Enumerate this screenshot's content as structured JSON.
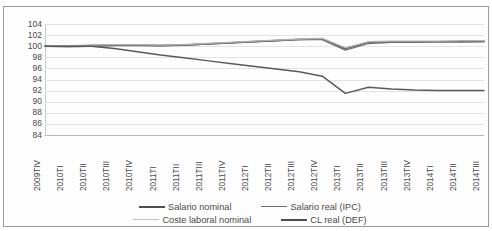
{
  "chart_data": {
    "type": "line",
    "title": "",
    "xlabel": "",
    "ylabel": "",
    "ylim": [
      84,
      104
    ],
    "ytick_step": 2,
    "yticks": [
      104,
      102,
      100,
      98,
      96,
      94,
      92,
      90,
      88,
      86,
      84
    ],
    "grid": true,
    "legend_position": "bottom",
    "categories": [
      "2009TIV",
      "2010TI",
      "2010TII",
      "2010TIII",
      "2010TIV",
      "2011TI",
      "2011TII",
      "2011TIII",
      "2011TIV",
      "2012TI",
      "2012TII",
      "2012TIII",
      "2012TIV",
      "2013TI",
      "2013TII",
      "2013TIII",
      "2013TIV",
      "2014TI",
      "2014TII",
      "2014TIII"
    ],
    "series": [
      {
        "name": "Salario nominal",
        "color": "#4d4d4d",
        "width": 1.6,
        "values": [
          100.0,
          100.0,
          100.1,
          100.2,
          100.2,
          100.1,
          100.2,
          100.4,
          100.6,
          100.8,
          101.0,
          101.2,
          101.3,
          99.6,
          100.7,
          100.8,
          100.8,
          100.8,
          100.8,
          100.9
        ]
      },
      {
        "name": "Salario real (IPC)",
        "color": "#6e6e6e",
        "width": 1.4,
        "values": [
          100.0,
          99.9,
          100.0,
          100.1,
          100.1,
          100.1,
          100.2,
          100.4,
          100.6,
          100.8,
          101.0,
          101.2,
          101.2,
          99.3,
          100.5,
          100.7,
          100.7,
          100.8,
          100.8,
          100.8
        ]
      },
      {
        "name": "Coste laboral nominal",
        "color": "#b0b0b0",
        "width": 1.3,
        "values": [
          100.0,
          100.1,
          100.2,
          100.3,
          100.3,
          100.2,
          100.3,
          100.5,
          100.7,
          100.9,
          101.1,
          101.3,
          101.4,
          99.7,
          100.8,
          100.9,
          100.9,
          100.9,
          101.0,
          101.0
        ]
      },
      {
        "name": "CL real (DEF)",
        "color": "#5a5a5a",
        "width": 1.5,
        "values": [
          100.0,
          100.0,
          100.0,
          99.6,
          99.0,
          98.4,
          97.9,
          97.4,
          96.9,
          96.4,
          95.9,
          95.4,
          94.6,
          91.5,
          92.6,
          92.3,
          92.1,
          92.0,
          92.0,
          92.0
        ]
      }
    ]
  },
  "legend": {
    "rows": [
      [
        {
          "label": "Salario nominal",
          "color": "#4d4d4d",
          "width": 2.2
        },
        {
          "label": "Salario real (IPC)",
          "color": "#6e6e6e",
          "width": 1.8
        }
      ],
      [
        {
          "label": "Coste laboral nominal",
          "color": "#c0c0c0",
          "width": 1.4
        },
        {
          "label": "CL real (DEF)",
          "color": "#4d4d4d",
          "width": 2.2
        }
      ]
    ]
  }
}
